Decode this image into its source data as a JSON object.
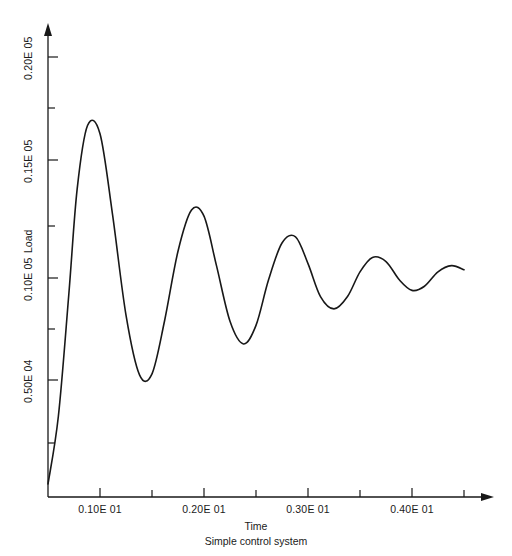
{
  "chart_data": {
    "type": "line",
    "title": "",
    "caption": "Simple control system",
    "xlabel": "Time",
    "ylabel": "Load",
    "xlim": [
      0.0,
      4.3
    ],
    "ylim": [
      0.0,
      22500.0
    ],
    "grid": false,
    "legend": null,
    "x_tick_labels": [
      "0.10E 01",
      "0.20E 01",
      "0.30E 01",
      "0.40E 01"
    ],
    "x_tick_values": [
      1.0,
      2.0,
      3.0,
      4.0
    ],
    "x_minor_tick_values": [
      0.5,
      1.5,
      2.5,
      3.5
    ],
    "y_tick_labels": [
      "0.50E 04",
      "0.10E 05",
      "0.15E 05",
      "0.20E 05"
    ],
    "y_tick_values": [
      5000,
      10000,
      15000,
      20000
    ],
    "y_minor_tick_values": [
      2500,
      7500,
      12500,
      17500
    ],
    "series": [
      {
        "name": "Load response",
        "x": [
          0.0,
          0.1,
          0.2,
          0.28,
          0.38,
          0.5,
          0.62,
          0.75,
          0.88,
          1.0,
          1.12,
          1.25,
          1.38,
          1.5,
          1.62,
          1.75,
          1.88,
          2.0,
          2.12,
          2.25,
          2.38,
          2.5,
          2.62,
          2.75,
          2.88,
          3.0,
          3.12,
          3.25,
          3.38,
          3.5,
          3.62,
          3.75,
          3.88,
          4.0
        ],
        "y": [
          0,
          3300,
          9200,
          14300,
          17400,
          17000,
          13100,
          8200,
          5300,
          5350,
          7900,
          11300,
          13300,
          13000,
          10600,
          7900,
          6800,
          7700,
          9900,
          11700,
          12000,
          10700,
          9100,
          8500,
          9100,
          10300,
          11000,
          10800,
          9900,
          9400,
          9600,
          10300,
          10600,
          10400
        ]
      }
    ],
    "annotations": [],
    "peaks": [
      {
        "x": 0.39,
        "y": 17450
      },
      {
        "x": 1.13,
        "y": 13300
      },
      {
        "x": 1.87,
        "y": 11950
      },
      {
        "x": 2.59,
        "y": 11300
      },
      {
        "x": 3.34,
        "y": 10800
      }
    ],
    "troughs": [
      {
        "x": 0.75,
        "y": 5200
      },
      {
        "x": 1.49,
        "y": 7800
      },
      {
        "x": 2.24,
        "y": 9000
      },
      {
        "x": 2.98,
        "y": 9650
      },
      {
        "x": 3.7,
        "y": 9950
      }
    ],
    "final_value": 10350
  },
  "axes": {
    "y_axis_label": "Load",
    "x_axis_label": "Time",
    "caption": "Simple control system"
  },
  "colors": {
    "background": "#ffffff",
    "axis": "#181818",
    "curve": "#181818",
    "text": "#1a1a1a"
  }
}
